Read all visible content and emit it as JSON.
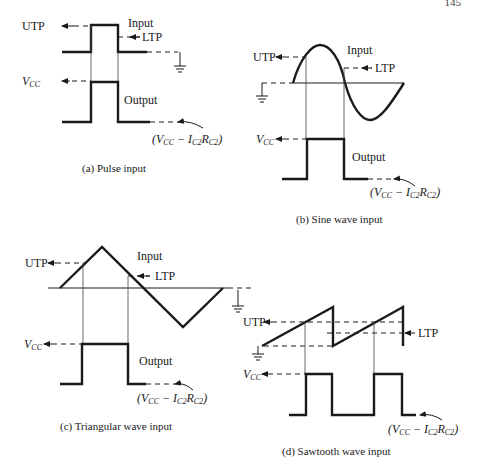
{
  "page": {
    "number": "145"
  },
  "labels": {
    "utp": "UTP",
    "ltp": "LTP",
    "input": "Input",
    "output": "Output",
    "vcc_main": "V",
    "vcc_sub": "CC",
    "low_level": {
      "open": "(V",
      "sub1": "CC",
      "minus": " − I",
      "sub2": "C2",
      "r": "R",
      "sub3": "C2",
      "close": ")"
    }
  },
  "panels": [
    {
      "id": "a",
      "caption": "(a)   Pulse input"
    },
    {
      "id": "b",
      "caption": "(b)   Sine wave input"
    },
    {
      "id": "c",
      "caption": "(c)   Triangular wave input"
    },
    {
      "id": "d",
      "caption": "(d)   Sawtooth wave input"
    }
  ]
}
